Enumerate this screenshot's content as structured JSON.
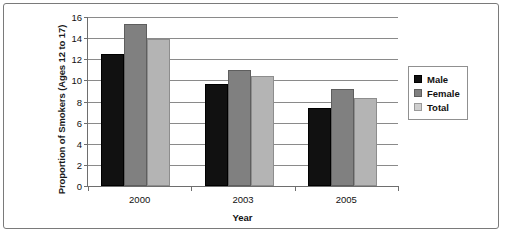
{
  "chart_data": {
    "type": "bar",
    "title": "",
    "xlabel": "Year",
    "ylabel": "Proportion of Smokers (Ages 12 to 17)",
    "categories": [
      "2000",
      "2003",
      "2005"
    ],
    "series": [
      {
        "name": "Male",
        "values": [
          12.5,
          9.7,
          7.4
        ],
        "color": "#111111"
      },
      {
        "name": "Female",
        "values": [
          15.3,
          11.0,
          9.2
        ],
        "color": "#808080"
      },
      {
        "name": "Total",
        "values": [
          13.9,
          10.4,
          8.3
        ],
        "color": "#b4b4b4"
      }
    ],
    "ylim": [
      0,
      16
    ],
    "ytick_values": [
      0,
      2,
      4,
      6,
      8,
      10,
      12,
      14,
      16
    ],
    "ytick_labels": [
      "0",
      "2",
      "4",
      "6",
      "8",
      "10",
      "12",
      "14",
      "16"
    ],
    "grid": true,
    "grid_axis": "y",
    "legend_position": "right",
    "legend_entries": [
      "Male",
      "Female",
      "Total"
    ]
  }
}
